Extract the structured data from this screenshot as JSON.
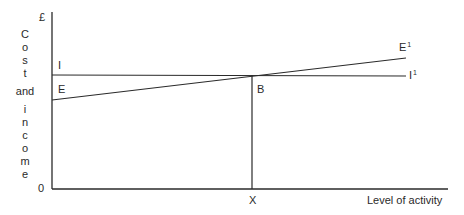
{
  "diagram": {
    "type": "break-even line diagram",
    "y_axis": {
      "label_letters": [
        "C",
        "o",
        "s",
        "t",
        "and",
        "i",
        "n",
        "c",
        "o",
        "m",
        "e"
      ],
      "label": "Cost and income",
      "unit_symbol": "£",
      "origin_label": "0"
    },
    "x_axis": {
      "label": "Level of activity",
      "marker_label": "X"
    },
    "lines": [
      {
        "name": "I",
        "start_label": "I",
        "end_label": "I",
        "end_superscript": "1",
        "description": "Horizontal income line"
      },
      {
        "name": "E",
        "start_label": "E",
        "end_label": "E",
        "end_superscript": "1",
        "description": "Upward sloping expenditure line"
      }
    ],
    "intersection_label": "B",
    "colors": {
      "line": "#2a2a2a",
      "background": "#ffffff"
    }
  }
}
